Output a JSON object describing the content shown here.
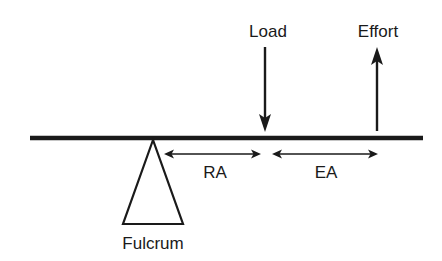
{
  "diagram": {
    "type": "lever",
    "labels": {
      "load": "Load",
      "effort": "Effort",
      "resistance_arm": "RA",
      "effort_arm": "EA",
      "fulcrum": "Fulcrum"
    },
    "colors": {
      "ink": "#1a1a1a",
      "background": "#ffffff"
    },
    "elements": {
      "beam": {
        "x1": 30,
        "x2": 423,
        "y": 138
      },
      "fulcrum": {
        "apex": [
          153,
          140
        ],
        "base_left": [
          123,
          224
        ],
        "base_right": [
          183,
          224
        ]
      },
      "load_arrow": {
        "x": 265,
        "y_from": 47,
        "y_to": 132,
        "direction": "down"
      },
      "effort_arrow": {
        "x": 377,
        "y_from": 131,
        "y_to": 47,
        "direction": "up"
      },
      "ra_arrow": {
        "x1": 164,
        "x2": 261,
        "y": 154,
        "direction": "both"
      },
      "ea_arrow": {
        "x1": 272,
        "x2": 378,
        "y": 154,
        "direction": "both"
      }
    }
  }
}
